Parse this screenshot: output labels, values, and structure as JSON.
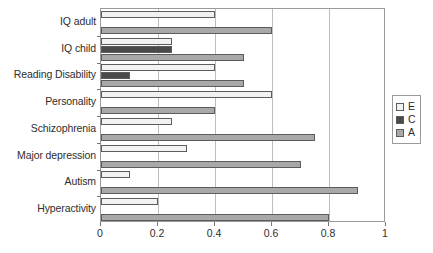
{
  "chart_data": {
    "type": "bar",
    "orientation": "horizontal",
    "title": "",
    "xlabel": "",
    "ylabel": "",
    "xlim": [
      0,
      1
    ],
    "grid": true,
    "legend_position": "right",
    "xticks": [
      "0",
      "0.2",
      "0.4",
      "0.6",
      "0.8",
      "1"
    ],
    "xtick_values": [
      0,
      0.2,
      0.4,
      0.6,
      0.8,
      1
    ],
    "categories": [
      "IQ adult",
      "IQ child",
      "Reading Disability",
      "Personality",
      "Schizophrenia",
      "Major depression",
      "Autism",
      "Hyperactivity"
    ],
    "series": [
      {
        "name": "E",
        "color": "#f2f2f2",
        "values": [
          0.4,
          0.25,
          0.4,
          0.6,
          0.25,
          0.3,
          0.1,
          0.2
        ]
      },
      {
        "name": "C",
        "color": "#4a4a4a",
        "values": [
          0,
          0.25,
          0.1,
          0,
          0,
          0,
          0,
          0
        ]
      },
      {
        "name": "A",
        "color": "#a8a8a8",
        "values": [
          0.6,
          0.5,
          0.5,
          0.4,
          0.75,
          0.7,
          0.9,
          0.8
        ]
      }
    ]
  },
  "legend": {
    "entries": [
      {
        "label": "E",
        "swatch": "legend-swatch-e"
      },
      {
        "label": "C",
        "swatch": "legend-swatch-c"
      },
      {
        "label": "A",
        "swatch": "legend-swatch-a"
      }
    ]
  },
  "caption": {
    "text": ""
  }
}
